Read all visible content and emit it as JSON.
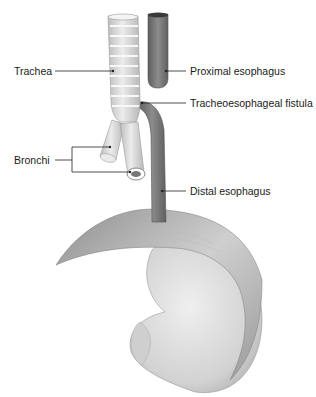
{
  "diagram": {
    "labels": {
      "trachea": "Trachea",
      "proximal_esophagus": "Proximal esophagus",
      "fistula": "Tracheoesophageal fistula",
      "bronchi": "Bronchi",
      "distal_esophagus": "Distal esophagus"
    },
    "colors": {
      "background": "#ffffff",
      "trachea_fill": "#dcdcdc",
      "esophagus_fill": "#7a7a7a",
      "diaphragm_fill": "#b5b5b5",
      "stomach_fill": "#d6d6d6",
      "leader_line": "#222222"
    }
  }
}
